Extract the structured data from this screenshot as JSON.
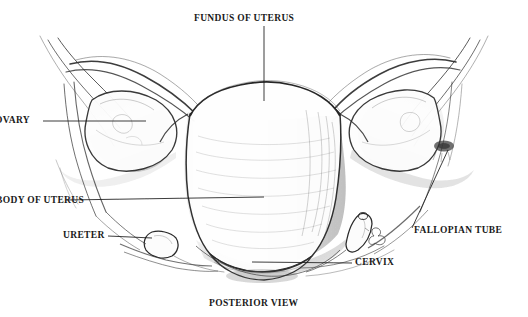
{
  "figure": {
    "title": "FUNDUS OF UTERUS",
    "caption": "POSTERIOR VIEW",
    "medium": "pencil-sketch-anatomical-illustration",
    "background_color": "#ffffff",
    "ink_color": "#1a1a1a",
    "sketch_color": "#4a4a4a",
    "labels": [
      {
        "id": "fundus",
        "text": "FUNDUS OF UTERUS",
        "leader": "vertical-down"
      },
      {
        "id": "ovary",
        "text": "OVARY",
        "leader": "horizontal-right"
      },
      {
        "id": "body",
        "text": "BODY OF UTERUS",
        "leader": "horizontal-right"
      },
      {
        "id": "ureter",
        "text": "URETER",
        "leader": "horizontal-right"
      },
      {
        "id": "cervix",
        "text": "CERVIX",
        "leader": "horizontal-left"
      },
      {
        "id": "fallopian",
        "text": "FALLOPIAN TUBE",
        "leader": "diagonal-up-left"
      }
    ],
    "signature_mark": "artist-monogram"
  }
}
